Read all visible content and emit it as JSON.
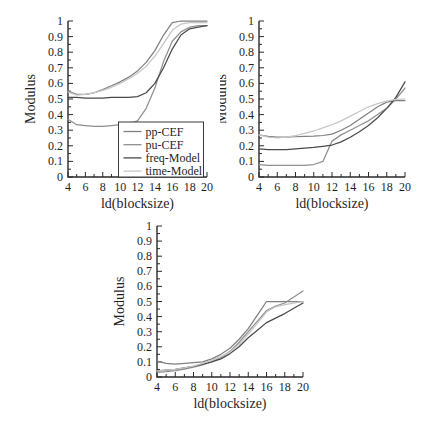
{
  "figure": {
    "background": "#ffffff",
    "axis_color": "#2a2a2a",
    "legend_border_color": "#3a3a3a",
    "legend_fill": "#ffffff"
  },
  "chart_data": [
    {
      "type": "line",
      "name": "top-left",
      "xlabel": "ld(blocksize)",
      "ylabel": "Modulus",
      "xlim": [
        4,
        20
      ],
      "ylim": [
        0,
        1
      ],
      "grid": false,
      "legend_position": "bottom-right-inside",
      "show_legend": true,
      "xticks": [
        4,
        6,
        8,
        10,
        12,
        14,
        16,
        18,
        20
      ],
      "xticklabels": [
        "4",
        "6",
        "8",
        "10",
        "12",
        "14",
        "16",
        "18",
        "20"
      ],
      "yticks": [
        0,
        0.1,
        0.2,
        0.3,
        0.4,
        0.5,
        0.6,
        0.7,
        0.8,
        0.9,
        1
      ],
      "yticklabels": [
        "0",
        "0.1",
        "0.2",
        "0.3",
        "0.4",
        "0.5",
        "0.6",
        "0.7",
        "0.8",
        "0.9",
        "1"
      ],
      "x": [
        4,
        5,
        6,
        7,
        8,
        9,
        10,
        11,
        12,
        13,
        14,
        15,
        16,
        17,
        18,
        19,
        20
      ],
      "series": [
        {
          "name": "pp-CEF",
          "color": "#808080",
          "values": [
            0.55,
            0.53,
            0.53,
            0.54,
            0.56,
            0.585,
            0.61,
            0.64,
            0.68,
            0.735,
            0.81,
            0.91,
            0.99,
            1.0,
            1.0,
            1.0,
            1.0
          ]
        },
        {
          "name": "pu-CEF",
          "color": "#8f8f8f",
          "values": [
            0.37,
            0.335,
            0.33,
            0.325,
            0.325,
            0.33,
            0.335,
            0.34,
            0.36,
            0.44,
            0.57,
            0.74,
            0.87,
            0.93,
            0.96,
            0.97,
            0.97
          ]
        },
        {
          "name": "freq-Model",
          "color": "#4a4a4a",
          "values": [
            0.51,
            0.51,
            0.505,
            0.505,
            0.505,
            0.51,
            0.51,
            0.51,
            0.515,
            0.54,
            0.6,
            0.7,
            0.82,
            0.91,
            0.95,
            0.96,
            0.97
          ]
        },
        {
          "name": "time-Model",
          "color": "#c6c6c6",
          "values": [
            0.545,
            0.525,
            0.53,
            0.54,
            0.555,
            0.575,
            0.6,
            0.63,
            0.665,
            0.71,
            0.775,
            0.855,
            0.94,
            0.98,
            0.99,
            0.99,
            0.99
          ]
        }
      ]
    },
    {
      "type": "line",
      "name": "top-right",
      "xlabel": "ld(blocksize)",
      "ylabel": "Modulus",
      "xlim": [
        4,
        20
      ],
      "ylim": [
        0,
        1
      ],
      "grid": false,
      "show_legend": false,
      "xticks": [
        4,
        6,
        8,
        10,
        12,
        14,
        16,
        18,
        20
      ],
      "xticklabels": [
        "4",
        "6",
        "8",
        "10",
        "12",
        "14",
        "16",
        "18",
        "20"
      ],
      "yticks": [
        0,
        0.1,
        0.2,
        0.3,
        0.4,
        0.5,
        0.6,
        0.7,
        0.8,
        0.9,
        1
      ],
      "yticklabels": [
        "0",
        "0.1",
        "0.2",
        "0.3",
        "0.4",
        "0.5",
        "0.6",
        "0.7",
        "0.8",
        "0.9",
        "1"
      ],
      "x": [
        4,
        5,
        6,
        7,
        8,
        9,
        10,
        11,
        12,
        13,
        14,
        15,
        16,
        17,
        18,
        19,
        20
      ],
      "series": [
        {
          "name": "pp-CEF",
          "color": "#808080",
          "values": [
            0.27,
            0.26,
            0.255,
            0.255,
            0.258,
            0.26,
            0.262,
            0.266,
            0.275,
            0.3,
            0.33,
            0.37,
            0.41,
            0.45,
            0.48,
            0.49,
            0.49
          ]
        },
        {
          "name": "pu-CEF",
          "color": "#8f8f8f",
          "values": [
            0.08,
            0.075,
            0.075,
            0.075,
            0.075,
            0.075,
            0.08,
            0.1,
            0.23,
            0.27,
            0.3,
            0.33,
            0.36,
            0.4,
            0.44,
            0.5,
            0.57
          ]
        },
        {
          "name": "freq-Model",
          "color": "#4a4a4a",
          "values": [
            0.18,
            0.175,
            0.175,
            0.175,
            0.18,
            0.185,
            0.19,
            0.197,
            0.205,
            0.225,
            0.255,
            0.29,
            0.33,
            0.38,
            0.44,
            0.51,
            0.61
          ]
        },
        {
          "name": "time-Model",
          "color": "#c6c6c6",
          "values": [
            0.27,
            0.256,
            0.25,
            0.255,
            0.265,
            0.28,
            0.295,
            0.315,
            0.335,
            0.36,
            0.39,
            0.42,
            0.45,
            0.47,
            0.487,
            0.497,
            0.5
          ]
        }
      ]
    },
    {
      "type": "line",
      "name": "bottom",
      "xlabel": "ld(blocksize)",
      "ylabel": "Modulus",
      "xlim": [
        4,
        20
      ],
      "ylim": [
        0,
        1
      ],
      "grid": false,
      "show_legend": false,
      "xticks": [
        4,
        6,
        8,
        10,
        12,
        14,
        16,
        18,
        20
      ],
      "xticklabels": [
        "4",
        "6",
        "8",
        "10",
        "12",
        "14",
        "16",
        "18",
        "20"
      ],
      "yticks": [
        0,
        0.1,
        0.2,
        0.3,
        0.4,
        0.5,
        0.6,
        0.7,
        0.8,
        0.9,
        1
      ],
      "yticklabels": [
        "0",
        "0.1",
        "0.2",
        "0.3",
        "0.4",
        "0.5",
        "0.6",
        "0.7",
        "0.8",
        "0.9",
        "1"
      ],
      "x": [
        4,
        5,
        6,
        7,
        8,
        9,
        10,
        11,
        12,
        13,
        14,
        15,
        16,
        17,
        18,
        19,
        20
      ],
      "series": [
        {
          "name": "pp-CEF",
          "color": "#808080",
          "values": [
            0.105,
            0.09,
            0.085,
            0.09,
            0.095,
            0.1,
            0.12,
            0.15,
            0.19,
            0.25,
            0.32,
            0.41,
            0.5,
            0.5,
            0.5,
            0.5,
            0.5
          ]
        },
        {
          "name": "pu-CEF",
          "color": "#8f8f8f",
          "values": [
            0.03,
            0.035,
            0.042,
            0.052,
            0.065,
            0.08,
            0.1,
            0.13,
            0.17,
            0.23,
            0.3,
            0.37,
            0.44,
            0.47,
            0.49,
            0.53,
            0.57
          ]
        },
        {
          "name": "freq-Model",
          "color": "#4a4a4a",
          "values": [
            0.04,
            0.045,
            0.05,
            0.06,
            0.07,
            0.085,
            0.1,
            0.12,
            0.155,
            0.2,
            0.26,
            0.31,
            0.36,
            0.39,
            0.42,
            0.455,
            0.49
          ]
        },
        {
          "name": "time-Model",
          "color": "#c6c6c6",
          "values": [
            0.04,
            0.045,
            0.05,
            0.06,
            0.072,
            0.09,
            0.11,
            0.135,
            0.165,
            0.215,
            0.285,
            0.355,
            0.43,
            0.465,
            0.48,
            0.49,
            0.5
          ]
        }
      ]
    }
  ]
}
